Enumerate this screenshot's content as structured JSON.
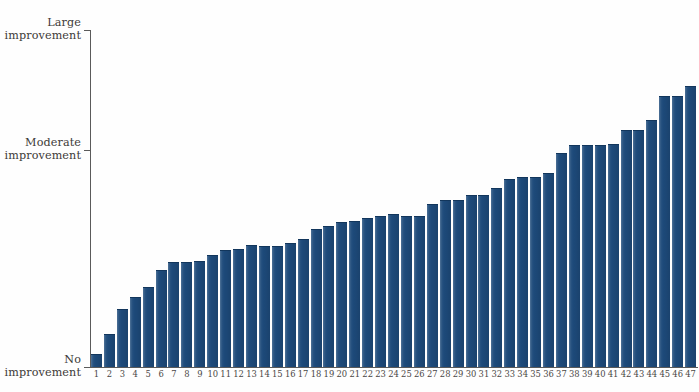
{
  "chart_data": {
    "type": "bar",
    "title": "",
    "subtitle": "",
    "xlabel": "",
    "ylabel": "",
    "grid": false,
    "legend": "none",
    "bar_color": "#1d4a7a",
    "axis_color": "#5a5a5a",
    "ylim": [
      0,
      1
    ],
    "y_axis_ticks": [
      {
        "value": 0,
        "label_line1": "No",
        "label_line2": "improvement"
      },
      {
        "value": 0.5,
        "label_line1": "Moderate",
        "label_line2": "improvement"
      },
      {
        "value": 1.0,
        "label_line1": "Large",
        "label_line2": "improvement"
      }
    ],
    "categories": [
      "1",
      "2",
      "3",
      "4",
      "5",
      "6",
      "7",
      "8",
      "9",
      "10",
      "11",
      "12",
      "13",
      "14",
      "15",
      "16",
      "17",
      "18",
      "19",
      "20",
      "21",
      "22",
      "23",
      "24",
      "25",
      "26",
      "27",
      "28",
      "29",
      "30",
      "31",
      "32",
      "33",
      "34",
      "35",
      "36",
      "37",
      "38",
      "39",
      "40",
      "41",
      "42",
      "43",
      "44",
      "45",
      "46",
      "47"
    ],
    "values": [
      0.035,
      0.095,
      0.17,
      0.205,
      0.235,
      0.285,
      0.31,
      0.308,
      0.312,
      0.33,
      0.345,
      0.348,
      0.358,
      0.356,
      0.356,
      0.366,
      0.378,
      0.408,
      0.415,
      0.428,
      0.43,
      0.438,
      0.446,
      0.45,
      0.444,
      0.445,
      0.482,
      0.492,
      0.492,
      0.506,
      0.506,
      0.528,
      0.556,
      0.56,
      0.56,
      0.572,
      0.632,
      0.655,
      0.655,
      0.655,
      0.658,
      0.7,
      0.7,
      0.73,
      0.8,
      0.8,
      0.83
    ]
  }
}
